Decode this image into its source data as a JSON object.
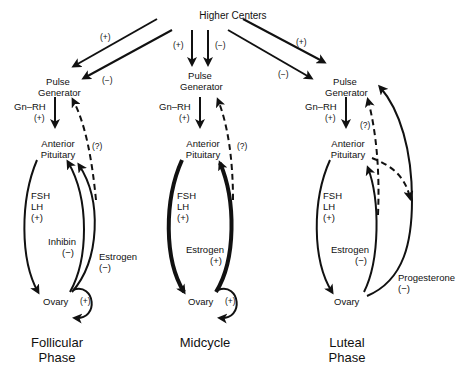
{
  "diagram": {
    "top_node": "Higher Centers",
    "top_arrows": {
      "follicular": {
        "upper": "(+)",
        "lower": "(−)"
      },
      "midcycle": {
        "left": "(+)",
        "right": "(−)"
      },
      "luteal": {
        "upper": "(+)",
        "lower": "(−)"
      }
    },
    "panels": [
      {
        "id": "follicular",
        "title_line1": "Follicular",
        "title_line2": "Phase",
        "pulse_generator_line1": "Pulse",
        "pulse_generator_line2": "Generator",
        "gnrh_label": "Gn–RH",
        "gnrh_sign": "(+)",
        "pituitary_line1": "Anterior",
        "pituitary_line2": "Pituitary",
        "question": "(?)",
        "fsh": "FSH",
        "lh": "LH",
        "fsh_lh_sign": "(+)",
        "feedback1_label": "Inhibin",
        "feedback1_sign": "(−)",
        "feedback2_label": "Estrogen",
        "feedback2_sign": "(−)",
        "ovary": "Ovary",
        "ovary_loop_sign": "(+)"
      },
      {
        "id": "midcycle",
        "title_line1": "Midcycle",
        "pulse_generator_line1": "Pulse",
        "pulse_generator_line2": "Generator",
        "gnrh_label": "Gn–RH",
        "gnrh_sign": "(+)",
        "pituitary_line1": "Anterior",
        "pituitary_line2": "Pituitary",
        "question": "(?)",
        "fsh": "FSH",
        "lh": "LH",
        "fsh_lh_sign": "(+)",
        "feedback1_label": "Estrogen",
        "feedback1_sign": "(+)",
        "ovary": "Ovary",
        "ovary_loop_sign": "(+)"
      },
      {
        "id": "luteal",
        "title_line1": "Luteal",
        "title_line2": "Phase",
        "pulse_generator_line1": "Pulse",
        "pulse_generator_line2": "Generator",
        "gnrh_label": "Gn–RH",
        "gnrh_sign": "(+)",
        "pituitary_line1": "Anterior",
        "pituitary_line2": "Pituitary",
        "question": "(?)",
        "fsh": "FSH",
        "lh": "LH",
        "fsh_lh_sign": "(+)",
        "feedback1_label": "Estrogen",
        "feedback1_sign": "(−)",
        "feedback2_label": "Progesterone",
        "feedback2_sign": "(−)",
        "ovary": "Ovary"
      }
    ],
    "colors": {
      "ink": "#111111",
      "background": "#ffffff"
    }
  }
}
